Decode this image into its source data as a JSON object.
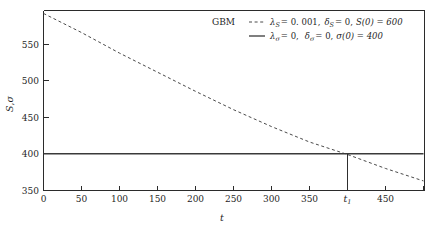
{
  "chart_data": {
    "type": "line",
    "title": "",
    "xlabel": "t",
    "ylabel": "S, σ",
    "xlim": [
      0,
      500
    ],
    "ylim": [
      350,
      595
    ],
    "grid": false,
    "legend_position": "top-right",
    "legend_title": "GBM",
    "xticks": [
      0,
      50,
      100,
      150,
      200,
      250,
      300,
      350,
      450
    ],
    "xtick_labels": [
      "0",
      "50",
      "100",
      "150",
      "200",
      "250",
      "300",
      "350",
      "450"
    ],
    "special_xtick": {
      "value": 400,
      "label": "t₁"
    },
    "yticks": [
      350,
      400,
      450,
      500,
      550
    ],
    "ytick_labels": [
      "350",
      "400",
      "450",
      "500",
      "550"
    ],
    "series": [
      {
        "name": "S",
        "style": "dashed",
        "legend_label": "λₛ = 0.001,  δₛ = 0, S(0) = 600",
        "x": [
          0,
          50,
          100,
          150,
          200,
          250,
          300,
          350,
          400,
          450,
          500
        ],
        "values": [
          591,
          565,
          537,
          511,
          485,
          460,
          437,
          416,
          399,
          380,
          363
        ]
      },
      {
        "name": "sigma",
        "style": "solid",
        "legend_label": "λσ = 0,  δσ = 0, σ(0) = 400",
        "x": [
          0,
          500
        ],
        "values": [
          400,
          400
        ]
      }
    ],
    "annotations": [
      {
        "name": "intersection-drop-line",
        "x": 400,
        "y_from": 400,
        "y_to": 350
      }
    ]
  },
  "legend": {
    "title": "GBM",
    "entries": [
      {
        "style": "dashed",
        "lambda_symbol": "λ",
        "lambda_sub": "S",
        "lambda_eq": "= 0. 001,",
        "delta_symbol": "δ",
        "delta_sub": "S",
        "delta_eq": "= 0,",
        "init_label": "S(0) = 600"
      },
      {
        "style": "solid",
        "lambda_symbol": "λ",
        "lambda_sub": "σ",
        "lambda_eq": "= 0,",
        "delta_symbol": "δ",
        "delta_sub": "σ",
        "delta_eq": "= 0,",
        "init_label": "σ(0) = 400"
      }
    ]
  },
  "axes": {
    "x_title": "t",
    "y_title_s": "S",
    "y_title_comma": ",",
    "y_title_sigma": "σ"
  },
  "colors": {
    "axis": "#2b2b2b",
    "dashed_series": "#4a4a4a",
    "solid_series": "#3a3a3a",
    "background": "#ffffff",
    "text": "#1f1f1f"
  }
}
